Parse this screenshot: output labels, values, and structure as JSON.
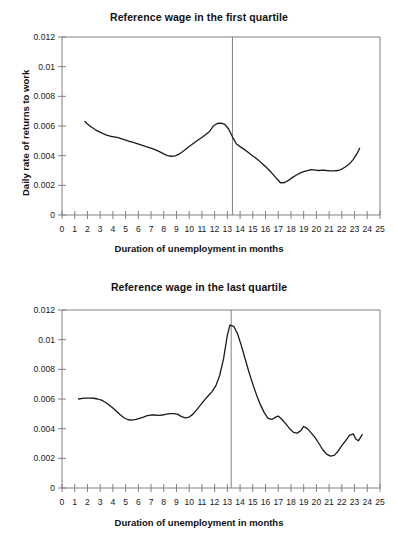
{
  "page": {
    "background": "#ffffff",
    "line_color": "#1a1a1a",
    "axis_color": "#808080",
    "marker_color": "#808080"
  },
  "figures": [
    {
      "id": "first-quartile",
      "title": "Reference wage in the first quartile",
      "xlabel": "Duration of unemployment in months",
      "ylabel": "Daily rate of returns to work"
    },
    {
      "id": "last-quartile",
      "title": "Reference wage in the last quartile",
      "xlabel": "Duration of unemployment in months",
      "ylabel": "Daily rate of returns to work"
    }
  ],
  "chart_data": [
    {
      "type": "line",
      "title": "Reference wage in the first quartile",
      "xlabel": "Duration of unemployment in months",
      "ylabel": "Daily rate of returns to work",
      "xlim": [
        0,
        25
      ],
      "ylim": [
        0,
        0.012
      ],
      "xticks": [
        0,
        1,
        2,
        3,
        4,
        5,
        6,
        7,
        8,
        9,
        10,
        11,
        12,
        13,
        14,
        15,
        16,
        17,
        18,
        19,
        20,
        21,
        22,
        23,
        24,
        25
      ],
      "xtick_labels": [
        "0",
        "1",
        "2",
        "3",
        "4",
        "5",
        "6",
        "7",
        "8",
        "9",
        "10",
        "11",
        "12",
        "13",
        "14",
        "15",
        "16",
        "17",
        "18",
        "19",
        "20",
        "21",
        "22",
        "23",
        "24",
        "25"
      ],
      "yticks": [
        0,
        0.002,
        0.004,
        0.006,
        0.008,
        0.01,
        0.012
      ],
      "ytick_labels": [
        "0",
        "0.002",
        "0.004",
        "0.006",
        "0.008",
        "0.01",
        "0.012"
      ],
      "grid": false,
      "legend": null,
      "annotations": [
        {
          "type": "vline",
          "x": 13.4,
          "label": "reference wage threshold"
        }
      ],
      "series": [
        {
          "name": "Daily rate of returns to work (first quartile)",
          "x": [
            1.8,
            2.0,
            2.3,
            2.6,
            2.9,
            3.2,
            3.5,
            3.8,
            4.1,
            4.4,
            4.7,
            5.0,
            5.3,
            5.6,
            5.9,
            6.2,
            6.5,
            6.8,
            7.1,
            7.4,
            7.7,
            8.0,
            8.3,
            8.6,
            8.9,
            9.2,
            9.5,
            9.8,
            10.1,
            10.4,
            10.7,
            11.0,
            11.3,
            11.6,
            11.9,
            12.2,
            12.5,
            12.8,
            13.1,
            13.4,
            13.7,
            14.0,
            14.3,
            14.6,
            14.9,
            15.2,
            15.5,
            15.8,
            16.1,
            16.4,
            16.7,
            17.0,
            17.2,
            17.5,
            17.8,
            18.1,
            18.4,
            18.7,
            19.0,
            19.3,
            19.6,
            19.9,
            20.2,
            20.5,
            20.8,
            21.1,
            21.4,
            21.7,
            22.0,
            22.3,
            22.6,
            22.9,
            23.2,
            23.4
          ],
          "y": [
            0.0063,
            0.00614,
            0.00593,
            0.00576,
            0.00562,
            0.0055,
            0.00539,
            0.00531,
            0.00527,
            0.00521,
            0.00513,
            0.00505,
            0.00497,
            0.00489,
            0.00481,
            0.00473,
            0.00464,
            0.00456,
            0.00447,
            0.00437,
            0.00426,
            0.00412,
            0.004,
            0.00396,
            0.00399,
            0.0041,
            0.00428,
            0.00448,
            0.00468,
            0.00487,
            0.00505,
            0.00523,
            0.00543,
            0.00563,
            0.006,
            0.00617,
            0.0062,
            0.00611,
            0.0058,
            0.00527,
            0.0048,
            0.00461,
            0.00444,
            0.00425,
            0.00405,
            0.00386,
            0.00365,
            0.00342,
            0.00318,
            0.00292,
            0.00262,
            0.00234,
            0.00216,
            0.00219,
            0.00233,
            0.00252,
            0.00268,
            0.00282,
            0.00292,
            0.00299,
            0.00306,
            0.00303,
            0.003,
            0.00303,
            0.003,
            0.00298,
            0.00297,
            0.003,
            0.0031,
            0.00325,
            0.00345,
            0.00375,
            0.00415,
            0.0045
          ]
        }
      ]
    },
    {
      "type": "line",
      "title": "Reference wage in the last quartile",
      "xlabel": "Duration of unemployment in months",
      "ylabel": "Daily rate of returns to work",
      "xlim": [
        0,
        25
      ],
      "ylim": [
        0,
        0.012
      ],
      "xticks": [
        0,
        1,
        2,
        3,
        4,
        5,
        6,
        7,
        8,
        9,
        10,
        11,
        12,
        13,
        14,
        15,
        16,
        17,
        18,
        19,
        20,
        21,
        22,
        23,
        24,
        25
      ],
      "xtick_labels": [
        "0",
        "1",
        "2",
        "3",
        "4",
        "5",
        "6",
        "7",
        "8",
        "9",
        "10",
        "11",
        "12",
        "13",
        "14",
        "15",
        "16",
        "17",
        "18",
        "19",
        "20",
        "21",
        "22",
        "23",
        "24",
        "25"
      ],
      "yticks": [
        0,
        0.002,
        0.004,
        0.006,
        0.008,
        0.01,
        0.012
      ],
      "ytick_labels": [
        "0",
        "0.002",
        "0.004",
        "0.006",
        "0.008",
        "0.01",
        "0.012"
      ],
      "grid": false,
      "legend": null,
      "annotations": [
        {
          "type": "vline",
          "x": 13.3,
          "label": "reference wage threshold"
        }
      ],
      "series": [
        {
          "name": "Daily rate of returns to work (last quartile)",
          "x": [
            1.3,
            1.6,
            1.9,
            2.2,
            2.5,
            2.8,
            3.1,
            3.4,
            3.7,
            4.0,
            4.3,
            4.6,
            4.9,
            5.2,
            5.5,
            5.8,
            6.1,
            6.4,
            6.7,
            7.0,
            7.3,
            7.6,
            7.9,
            8.2,
            8.5,
            8.8,
            9.1,
            9.4,
            9.7,
            10.0,
            10.3,
            10.6,
            10.9,
            11.2,
            11.5,
            11.8,
            12.1,
            12.4,
            12.7,
            13.0,
            13.2,
            13.5,
            13.8,
            14.1,
            14.4,
            14.7,
            15.0,
            15.3,
            15.6,
            15.9,
            16.2,
            16.5,
            16.8,
            17.0,
            17.3,
            17.6,
            17.9,
            18.2,
            18.5,
            18.8,
            19.0,
            19.3,
            19.6,
            19.9,
            20.2,
            20.5,
            20.8,
            21.1,
            21.4,
            21.7,
            22.0,
            22.3,
            22.6,
            22.9,
            23.1,
            23.3,
            23.6
          ],
          "y": [
            0.006,
            0.00604,
            0.00606,
            0.00606,
            0.00605,
            0.006,
            0.00592,
            0.00578,
            0.0056,
            0.0054,
            0.00516,
            0.00492,
            0.00472,
            0.0046,
            0.00458,
            0.00462,
            0.0047,
            0.00478,
            0.00488,
            0.00492,
            0.00492,
            0.0049,
            0.00492,
            0.00498,
            0.00502,
            0.00502,
            0.00496,
            0.00481,
            0.00473,
            0.00478,
            0.00498,
            0.00528,
            0.0056,
            0.00592,
            0.00622,
            0.0065,
            0.0069,
            0.0076,
            0.0087,
            0.0103,
            0.01098,
            0.0109,
            0.0104,
            0.0096,
            0.0087,
            0.0078,
            0.007,
            0.00626,
            0.00562,
            0.00508,
            0.0047,
            0.00462,
            0.00478,
            0.00485,
            0.00462,
            0.00432,
            0.004,
            0.00375,
            0.0037,
            0.0039,
            0.00415,
            0.004,
            0.0037,
            0.0034,
            0.003,
            0.00258,
            0.00228,
            0.00215,
            0.0022,
            0.00248,
            0.00285,
            0.0032,
            0.00355,
            0.00365,
            0.0033,
            0.00318,
            0.0036
          ]
        }
      ]
    }
  ]
}
